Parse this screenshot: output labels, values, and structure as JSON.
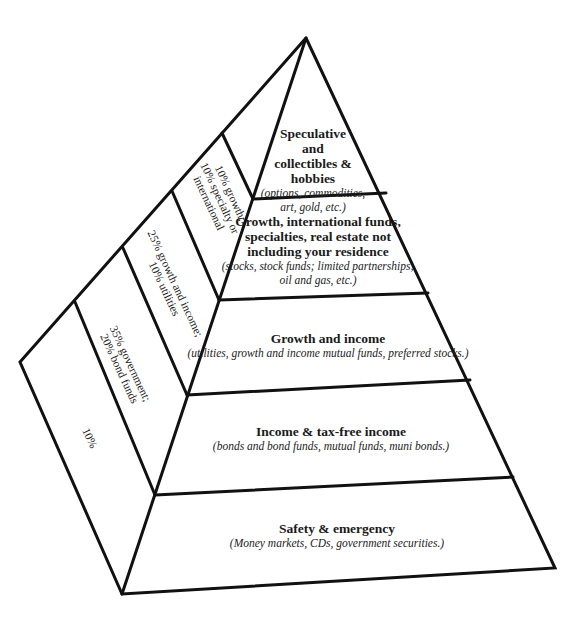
{
  "diagram": {
    "type": "investment pyramid",
    "front_tiers": [
      {
        "title_lines": [
          "Speculative",
          "and",
          "collectibles &",
          "hobbies"
        ],
        "subtitle_lines": [
          "(options, commodities,",
          "art, gold, etc.)"
        ]
      },
      {
        "title_lines": [
          "Growth, international funds,",
          "specialties, real estate not",
          "including your residence"
        ],
        "subtitle_lines": [
          "(stocks, stock funds; limited partnerships;",
          "oil and gas, etc.)"
        ]
      },
      {
        "title_lines": [
          "Growth and income"
        ],
        "subtitle_lines": [
          "(utilities, growth and income mutual funds, preferred stocks.)"
        ]
      },
      {
        "title_lines": [
          "Income & tax-free income"
        ],
        "subtitle_lines": [
          "(bonds and bond funds, mutual funds, muni bonds.)"
        ]
      },
      {
        "title_lines": [
          "Safety & emergency"
        ],
        "subtitle_lines": [
          "(Money markets, CDs, government securities.)"
        ]
      }
    ],
    "side_labels": [
      {
        "lines": [
          "10% growth;",
          "10% specialty or",
          "international"
        ]
      },
      {
        "lines": [
          "25% growth and income;",
          "10% utilities"
        ]
      },
      {
        "lines": [
          "35% government;",
          "20% bond funds"
        ]
      },
      {
        "lines": [
          "10%"
        ]
      }
    ]
  }
}
